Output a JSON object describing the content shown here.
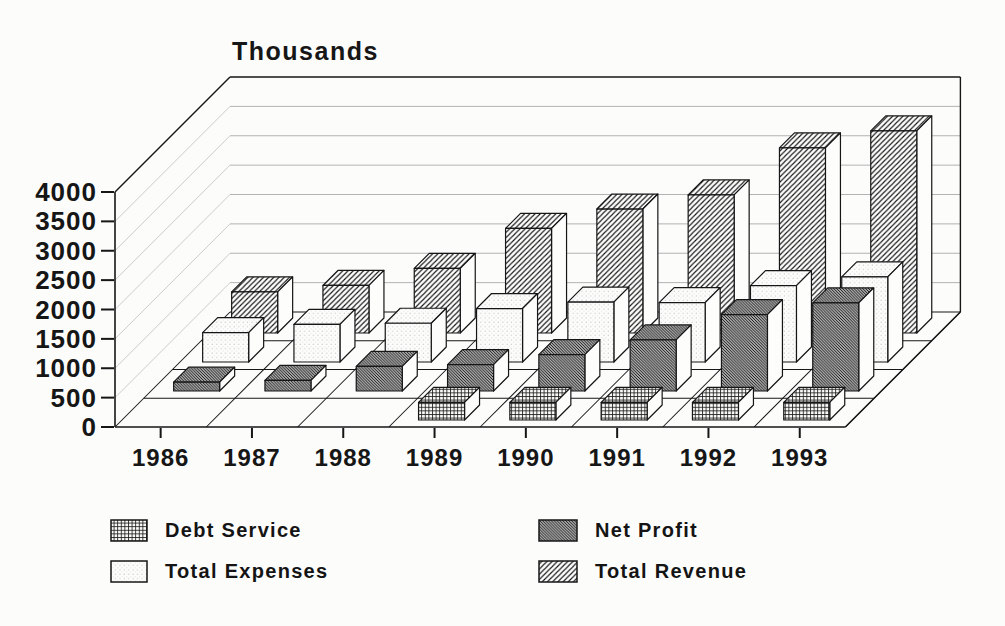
{
  "chart_data": {
    "type": "bar",
    "projection": "3d-oblique",
    "axis_title": "Thousands",
    "categories": [
      "1986",
      "1987",
      "1988",
      "1989",
      "1990",
      "1991",
      "1992",
      "1993"
    ],
    "series": [
      {
        "name": "Debt Service",
        "row": 0,
        "pattern": "grid",
        "values": [
          0,
          0,
          0,
          300,
          300,
          300,
          300,
          300
        ]
      },
      {
        "name": "Net Profit",
        "row": 1,
        "pattern": "diagonal-dense",
        "values": [
          150,
          180,
          420,
          450,
          620,
          870,
          1300,
          1500
        ]
      },
      {
        "name": "Total Expenses",
        "row": 2,
        "pattern": "dots",
        "values": [
          500,
          640,
          660,
          910,
          1020,
          1010,
          1300,
          1450
        ]
      },
      {
        "name": "Total Revenue",
        "row": 3,
        "pattern": "diagonal",
        "values": [
          700,
          810,
          1100,
          1780,
          2110,
          2350,
          3150,
          3440
        ]
      }
    ],
    "ylim": [
      0,
      4000
    ],
    "ytick_step": 500,
    "ytick_labels": [
      "0",
      "500",
      "1000",
      "1500",
      "2000",
      "2500",
      "3000",
      "3500",
      "4000"
    ],
    "grid": "on",
    "legend_position": "bottom",
    "colors": {
      "ink": "#161616",
      "paper": "#fcfcfb",
      "gridline": "#b3b3b3",
      "wall_line": "#c6c6c6"
    }
  }
}
